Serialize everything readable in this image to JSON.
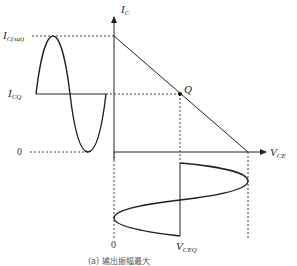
{
  "diagram": {
    "axes": {
      "y_axis_label": "I",
      "y_axis_sub": "C",
      "x_axis_label": "V",
      "x_axis_sub": "CE"
    },
    "labels": {
      "ic_sat": "I",
      "ic_sat_sub": "C(sat)",
      "icq": "I",
      "icq_sub": "CQ",
      "q_point": "Q",
      "zero_left": "0",
      "zero_bottom": "0",
      "vceq": "V",
      "vceq_sub": "CEQ"
    },
    "caption": "(a) 输出振幅最大",
    "colors": {
      "line": "#222222",
      "dashed": "#444444",
      "background": "#ffffff"
    }
  }
}
